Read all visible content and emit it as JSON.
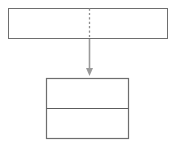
{
  "diagram": {
    "background_color": "#ffffff",
    "canvas": {
      "width": 175,
      "height": 147
    },
    "shapes": [
      {
        "id": "top-block",
        "name": "top-rectangle",
        "type": "rectangle",
        "label": "",
        "x": 8.5,
        "y": 8.5,
        "width": 159,
        "height": 30,
        "stroke_color": "#6e6e6e",
        "stroke_width": 1,
        "fill_color": "#ffffff"
      },
      {
        "id": "bottom-block",
        "name": "bottom-rectangle",
        "type": "rectangle",
        "label": "",
        "x": 46.5,
        "y": 78.5,
        "width": 82,
        "height": 60,
        "stroke_color": "#5c5c5c",
        "stroke_width": 1.2,
        "fill_color": "#ffffff"
      }
    ],
    "dividers": [
      {
        "id": "top-divider",
        "name": "top-rectangle-dashed-divider",
        "type": "dashed-vertical",
        "x": 89.5,
        "y1": 8.5,
        "y2": 38.5,
        "color": "#8f8f8f",
        "dash_pattern": "2.2 2.2"
      },
      {
        "id": "bottom-divider",
        "name": "bottom-rectangle-horizontal-divider",
        "type": "solid-horizontal",
        "y": 108.5,
        "x1": 46.5,
        "x2": 128.5,
        "color": "#5c5c5c"
      }
    ],
    "connectors": [
      {
        "id": "arrow-1",
        "name": "downward-arrow",
        "type": "arrow",
        "direction": "down",
        "label": "",
        "x": 89.5,
        "y_start": 39,
        "y_end": 76,
        "color": "#9a9a9a",
        "stroke_width": 1.6,
        "head_width": 7,
        "head_height": 8
      }
    ]
  }
}
